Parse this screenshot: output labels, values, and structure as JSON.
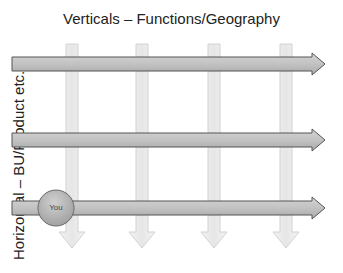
{
  "title": "Verticals – Functions/Geography",
  "side_label": "Horizontal – BU/Product etc.",
  "you_label": "You",
  "colors": {
    "horizontal_fill": "#bdbdbd",
    "horizontal_stroke": "#555555",
    "vertical_fill": "#efefef",
    "vertical_stroke": "#cfcfcf",
    "circle_fill": "#b5b5b5",
    "circle_stroke": "#666666"
  },
  "vertical_arrows": [
    {
      "name": "vertical-1",
      "x": 72
    },
    {
      "name": "vertical-2",
      "x": 142
    },
    {
      "name": "vertical-3",
      "x": 214
    },
    {
      "name": "vertical-4",
      "x": 286
    }
  ],
  "horizontal_arrows": [
    {
      "name": "horizontal-1",
      "y": 64
    },
    {
      "name": "horizontal-2",
      "y": 140
    },
    {
      "name": "horizontal-3",
      "y": 208
    }
  ]
}
